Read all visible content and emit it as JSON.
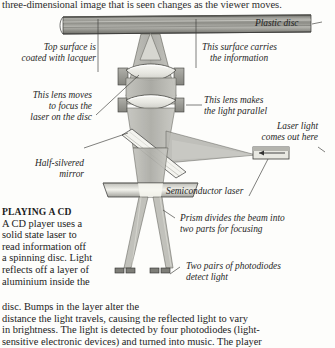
{
  "page": {
    "top_running_text": "three-dimensional image that is seen changes as the viewer moves."
  },
  "diagram": {
    "labels": {
      "plastic_disc": "Plastic disc",
      "top_surface_line1": "Top surface is",
      "top_surface_line2": "coated with lacquer",
      "surface_carries_line1": "This surface carries",
      "surface_carries_line2": "the information",
      "focus_lens_line1": "This lens moves",
      "focus_lens_line2": "to focus the",
      "focus_lens_line3": "laser on the disc",
      "parallel_lens_line1": "This lens makes",
      "parallel_lens_line2": "the light parallel",
      "laser_light_line1": "Laser light",
      "laser_light_line2": "comes out here",
      "half_silvered_line1": "Half-silvered",
      "half_silvered_line2": "mirror",
      "semiconductor_laser": "Semiconductor laser",
      "prism_line1": "Prism divides the beam into",
      "prism_line2": "two parts for focusing",
      "photodiodes_line1": "Two pairs of photodiodes",
      "photodiodes_line2": "detect light"
    },
    "colors": {
      "beam_fill": "#b3b3ad",
      "disc_fill": "#9b9b95",
      "lens_fill": "#efefea",
      "mount_fill": "#9e9e98",
      "stroke": "#3a3a38",
      "page_bg": "#fdfdfb"
    }
  },
  "article": {
    "heading": "PLAYING A CD",
    "column_lines": [
      "A CD player uses a",
      "solid state laser to",
      "read information off",
      "a spinning disc. Light",
      "reflects off a layer of",
      "aluminium inside the"
    ],
    "full_width_lines": [
      "disc. Bumps in the layer alter the",
      "distance the light travels, causing the reflected light to vary",
      "in brightness. The light is detected by four photodiodes (light-",
      "sensitive electronic devices) and turned into music. The player"
    ]
  }
}
